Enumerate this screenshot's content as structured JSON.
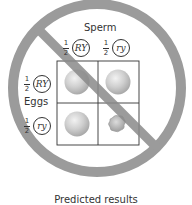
{
  "diagram": {
    "title": "Predicted results",
    "crossed_out": true,
    "sperm": {
      "label": "Sperm",
      "gametes": [
        {
          "fraction_num": "1",
          "fraction_den": "2",
          "allele": "RY"
        },
        {
          "fraction_num": "1",
          "fraction_den": "2",
          "allele": "ry"
        }
      ]
    },
    "eggs": {
      "label": "Eggs",
      "gametes": [
        {
          "fraction_num": "1",
          "fraction_den": "2",
          "allele": "RY"
        },
        {
          "fraction_num": "1",
          "fraction_den": "2",
          "allele": "ry"
        }
      ]
    },
    "punnett": [
      [
        "round-yellow-pea",
        "round-yellow-pea"
      ],
      [
        "round-yellow-pea",
        "wrinkled-green-pea"
      ]
    ],
    "colors": {
      "prohibition_ring": "#8a8a8a",
      "pea_round": "#c8c8c8",
      "pea_wrinkled": "#b0b0b0",
      "grid_line": "#333333"
    }
  }
}
